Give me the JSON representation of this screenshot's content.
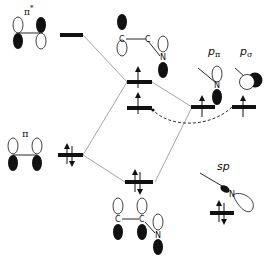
{
  "diagram": {
    "type": "molecular-orbital-diagram",
    "colors": {
      "level_bar": "#111111",
      "connector": "#9a9a9a",
      "lobe_filled": "#111111",
      "lobe_empty": "#ffffff",
      "dashed": "#333333"
    },
    "labels": {
      "pi_star": "π",
      "pi_star_sup": "*",
      "pi": "π",
      "p_pi_main": "p",
      "p_pi_sub": "π",
      "p_sigma_main": "p",
      "p_sigma_sub": "σ",
      "sp": "sp"
    },
    "atoms": {
      "c1_top": "C",
      "c2_top": "C",
      "n_top": "N",
      "n_ppi": "N",
      "c1_bottom": "C",
      "c2_bottom": "C",
      "n_bottom": "N",
      "n_sp": "N"
    },
    "levels": [
      {
        "id": "pi-star",
        "electrons": 0
      },
      {
        "id": "mixed-upper",
        "electrons": 1
      },
      {
        "id": "mixed-middle",
        "electrons": 1
      },
      {
        "id": "pi",
        "electrons": 2
      },
      {
        "id": "mixed-lower",
        "electrons": 2
      },
      {
        "id": "n-p-pi",
        "electrons": 1
      },
      {
        "id": "n-p-sigma",
        "electrons": 1
      },
      {
        "id": "n-sp",
        "electrons": 2
      }
    ]
  }
}
